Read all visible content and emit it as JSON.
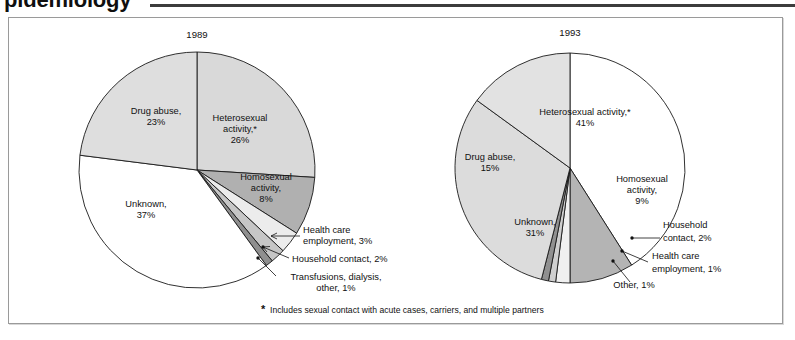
{
  "page": {
    "chapter_heading": "pidemiology"
  },
  "figure": {
    "footnote_marker": "*",
    "footnote": "Includes sexual contact with acute cases, carriers, and multiple partners"
  },
  "chart_data": [
    {
      "type": "pie",
      "title": "1989",
      "start_angle_deg": 0,
      "direction": "clockwise",
      "categories": [
        "Heterosexual activity,*",
        "Homosexual activity,",
        "Health care employment,",
        "Household contact,",
        "Transfusions, dialysis, other,",
        "Unknown,",
        "Drug abuse,"
      ],
      "values": [
        26,
        8,
        3,
        2,
        1,
        37,
        23
      ],
      "value_labels": [
        "26%",
        "8%",
        "3%",
        "2%",
        "1%",
        "37%",
        "23%"
      ],
      "colors": [
        "#d9d9d9",
        "#b0b0b0",
        "#ececec",
        "#c6c6c6",
        "#8f8f8f",
        "#ffffff",
        "#dedede"
      ],
      "inside_labels": [
        {
          "text_lines": [
            "Heterosexual",
            "activity,*",
            "26%"
          ]
        },
        {
          "text_lines": [
            "Homosexual",
            "activity,",
            "8%"
          ]
        },
        {
          "text_lines": [
            "Unknown,",
            "37%"
          ]
        },
        {
          "text_lines": [
            "Drug abuse,",
            "23%"
          ]
        }
      ],
      "callout_labels": [
        {
          "text_lines": [
            "Health care",
            "employment,  3%"
          ]
        },
        {
          "text_lines": [
            "Household contact, 2%"
          ]
        },
        {
          "text_lines": [
            "Transfusions, dialysis,",
            "other,  1%"
          ]
        }
      ]
    },
    {
      "type": "pie",
      "title": "1993",
      "start_angle_deg": 0,
      "direction": "clockwise",
      "categories": [
        "Heterosexual activity,*",
        "Homosexual activity,",
        "Household contact,",
        "Health care employment,",
        "Other,",
        "Unknown,",
        "Drug abuse,"
      ],
      "values": [
        41,
        9,
        2,
        1,
        1,
        31,
        15
      ],
      "value_labels": [
        "41%",
        "9%",
        "2%",
        "1%",
        "1%",
        "31%",
        "15%"
      ],
      "colors": [
        "#ffffff",
        "#b4b4b4",
        "#f0f0f0",
        "#cfcfcf",
        "#909090",
        "#dcdcdc",
        "#e2e2e2"
      ],
      "inside_labels": [
        {
          "text_lines": [
            "Heterosexual activity,*",
            "41%"
          ]
        },
        {
          "text_lines": [
            "Homosexual",
            "activity,",
            "9%"
          ]
        },
        {
          "text_lines": [
            "Unknown,",
            "31%"
          ]
        },
        {
          "text_lines": [
            "Drug abuse,",
            "15%"
          ]
        }
      ],
      "callout_labels": [
        {
          "text_lines": [
            "Household",
            "contact,  2%"
          ]
        },
        {
          "text_lines": [
            "Health care",
            "employment,  1%"
          ]
        },
        {
          "text_lines": [
            "Other,  1%"
          ]
        }
      ]
    }
  ],
  "left_chart": {
    "year": "1989",
    "label_hetero_1": "Heterosexual",
    "label_hetero_2": "activity,*",
    "label_hetero_3": "26%",
    "label_drug_1": "Drug abuse,",
    "label_drug_2": "23%",
    "label_unknown_1": "Unknown,",
    "label_unknown_2": "37%",
    "label_homo_1": "Homosexual",
    "label_homo_2": "activity,",
    "label_homo_3": "8%",
    "callout_health_1": "Health care",
    "callout_health_2": "employment,  3%",
    "callout_household": "Household contact, 2%",
    "callout_transf_1": "Transfusions, dialysis,",
    "callout_transf_2": "other,  1%"
  },
  "right_chart": {
    "year": "1993",
    "label_hetero_1": "Heterosexual activity,*",
    "label_hetero_2": "41%",
    "label_drug_1": "Drug abuse,",
    "label_drug_2": "15%",
    "label_unknown_1": "Unknown,",
    "label_unknown_2": "31%",
    "label_homo_1": "Homosexual",
    "label_homo_2": "activity,",
    "label_homo_3": "9%",
    "callout_household_1": "Household",
    "callout_household_2": "contact,  2%",
    "callout_health_1": "Health care",
    "callout_health_2": "employment,  1%",
    "callout_other": "Other,  1%"
  }
}
